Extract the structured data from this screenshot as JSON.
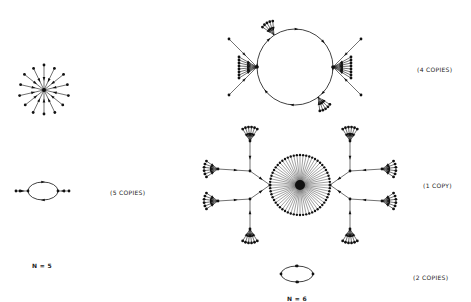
{
  "labels": {
    "copies_5": "(5 COPIES)",
    "copies_4": "(4 COPIES)",
    "copies_1": "(1 COPY)",
    "copies_2": "(2 COPIES)",
    "n5": "N = 5",
    "n6": "N = 6"
  },
  "colors": {
    "ink": "#111111",
    "background": "#ffffff"
  },
  "figures": [
    {
      "id": "n5-star",
      "description": "star: central node with 14 spokes, arrows inward"
    },
    {
      "id": "n5-cycle",
      "description": "2-cycle with chained tails on both sides",
      "copies": "(5 COPIES)"
    },
    {
      "id": "n6-big-cycle",
      "description": "large cycle with attached fan trees",
      "copies": "(4 COPIES)"
    },
    {
      "id": "n6-big-star-tree",
      "description": "dense central star with branching trees",
      "copies": "(1 COPY)"
    },
    {
      "id": "n6-small-cycle",
      "description": "small 4-node cycle",
      "copies": "(2 COPIES)"
    }
  ]
}
